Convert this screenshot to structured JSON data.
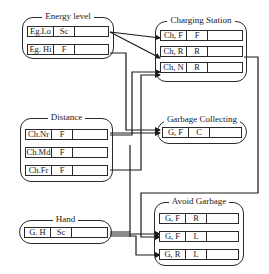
{
  "diagram": {
    "groups": {
      "energy_level": {
        "title": "Energy level",
        "rows": [
          {
            "key": "Eg.Lo",
            "value": "Sc",
            "slot": ""
          },
          {
            "key": "Eg. Hi",
            "value": "F",
            "slot": ""
          }
        ]
      },
      "distance": {
        "title": "Distance",
        "rows": [
          {
            "key": "Ch.Nr",
            "value": "F",
            "slot": ""
          },
          {
            "key": "Ch.Md",
            "value": "F",
            "slot": ""
          },
          {
            "key": "Ch.Fr",
            "value": "F",
            "slot": ""
          }
        ]
      },
      "hand": {
        "title": "Hand",
        "rows": [
          {
            "key": "G. H",
            "value": "Sc",
            "slot": ""
          }
        ]
      },
      "charging_station": {
        "title": "Charging Station",
        "rows": [
          {
            "key": "Ch, F",
            "value": "F",
            "slot": ""
          },
          {
            "key": "Ch, R",
            "value": "R",
            "slot": ""
          },
          {
            "key": "Ch, N",
            "value": "R",
            "slot": ""
          }
        ]
      },
      "garbage_collecting": {
        "title": "Garbage Collecting",
        "rows": [
          {
            "key": "G, F",
            "value": "C",
            "slot": ""
          }
        ]
      },
      "avoid_garbage": {
        "title": "Avoid Garbage",
        "rows": [
          {
            "key": "G, F",
            "value": "R",
            "slot": ""
          },
          {
            "key": "G, F",
            "value": "L",
            "slot": ""
          },
          {
            "key": "G, R",
            "value": "L",
            "slot": ""
          }
        ]
      }
    },
    "connections": [
      {
        "from": "Energy level / Eg.Lo",
        "to": "Charging Station / Ch, F"
      },
      {
        "from": "Energy level / Eg.Lo",
        "to": "Charging Station / Ch, R"
      },
      {
        "from": "Energy level / Eg. Hi",
        "to": "Garbage Collecting / G, F"
      },
      {
        "from": "Distance / Ch.Nr",
        "to": "Charging Station / Ch, N"
      },
      {
        "from": "Distance / Ch.Fr",
        "to": "Charging Station / Ch, N"
      },
      {
        "from": "Distance / Ch.Nr",
        "to": "Garbage Collecting / G, F"
      },
      {
        "from": "Charging Station / Ch, R",
        "to": "Avoid Garbage / G, F (L)"
      },
      {
        "from": "Hand / G. H",
        "to": "Avoid Garbage / G, F (L)"
      },
      {
        "from": "Hand / G. H",
        "to": "Avoid Garbage / G, R"
      }
    ],
    "colors": {
      "line": "#1a1a1a",
      "background": "#ffffff"
    }
  }
}
